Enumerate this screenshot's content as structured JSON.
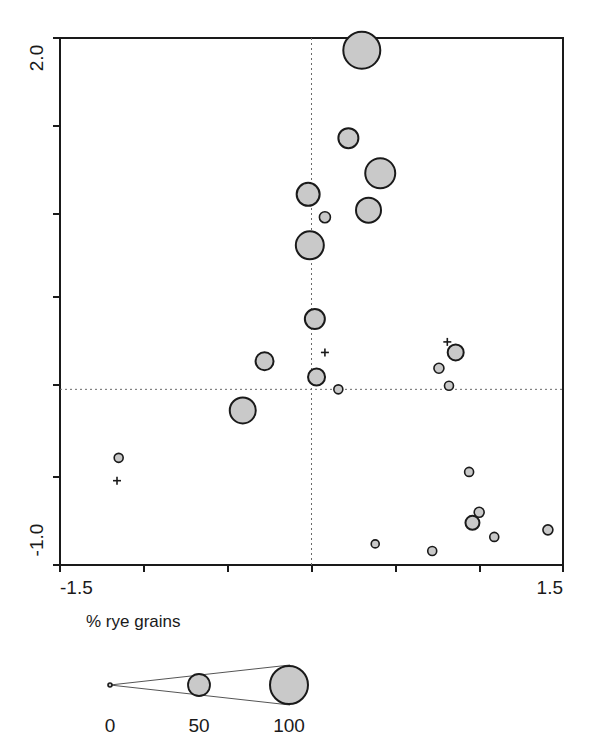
{
  "chart_data": {
    "type": "scatter",
    "title": "",
    "subtitle": "",
    "xlabel": "",
    "ylabel": "",
    "xlim": [
      -1.5,
      1.5
    ],
    "ylim": [
      -1.0,
      2.0
    ],
    "grid": false,
    "legend_position": "below-plot",
    "x_tick_labels": [
      "-1.5",
      "1.5"
    ],
    "y_tick_labels": [
      "2.0",
      "-1.0"
    ],
    "x_ticks": [
      -1.5,
      -1.0,
      -0.5,
      0.0,
      0.5,
      1.0,
      1.5
    ],
    "y_ticks": [
      2.0,
      1.5,
      1.0,
      0.5,
      0.0,
      -0.5,
      -1.0
    ],
    "reference_lines": [
      {
        "orientation": "vertical",
        "value": 0.0,
        "style": "dotted"
      },
      {
        "orientation": "horizontal",
        "value": 0.0,
        "style": "dotted"
      }
    ],
    "size_variable": "% rye grains",
    "size_legend": {
      "title": "% rye grains",
      "ticks": [
        "0",
        "50",
        "100"
      ],
      "values": [
        0,
        50,
        100
      ],
      "radii_px": [
        1,
        11,
        19
      ]
    },
    "marker_fill": "#c9c9c9",
    "marker_stroke": "#1a1a1a",
    "points": [
      {
        "x": 0.3,
        "y": 1.93,
        "size": 100,
        "r": 18.5,
        "label": ""
      },
      {
        "x": 0.22,
        "y": 1.43,
        "size": 66,
        "r": 10.0,
        "label": ""
      },
      {
        "x": 0.41,
        "y": 1.23,
        "size": 88,
        "r": 15.0,
        "label": ""
      },
      {
        "x": -0.02,
        "y": 1.11,
        "size": 72,
        "r": 11.5,
        "label": ""
      },
      {
        "x": 0.34,
        "y": 1.02,
        "size": 78,
        "r": 12.5,
        "label": ""
      },
      {
        "x": 0.08,
        "y": 0.98,
        "size": 30,
        "r": 5.5,
        "label": ""
      },
      {
        "x": -0.01,
        "y": 0.82,
        "size": 84,
        "r": 14.0,
        "label": ""
      },
      {
        "x": 0.02,
        "y": 0.4,
        "size": 66,
        "r": 10.0,
        "label": ""
      },
      {
        "x": -0.28,
        "y": 0.16,
        "size": 60,
        "r": 9.0,
        "label": ""
      },
      {
        "x": 0.03,
        "y": 0.07,
        "size": 58,
        "r": 8.5,
        "label": ""
      },
      {
        "x": 0.16,
        "y": 0.0,
        "size": 22,
        "r": 4.5,
        "label": ""
      },
      {
        "x": -0.41,
        "y": -0.12,
        "size": 80,
        "r": 13.0,
        "label": ""
      },
      {
        "x": 0.86,
        "y": 0.21,
        "size": 52,
        "r": 8.0,
        "label": ""
      },
      {
        "x": 0.76,
        "y": 0.12,
        "size": 24,
        "r": 5.0,
        "label": ""
      },
      {
        "x": 0.82,
        "y": 0.02,
        "size": 20,
        "r": 4.5,
        "label": ""
      },
      {
        "x": -1.15,
        "y": -0.39,
        "size": 22,
        "r": 4.5,
        "label": ""
      },
      {
        "x": 0.94,
        "y": -0.47,
        "size": 22,
        "r": 4.5,
        "label": ""
      },
      {
        "x": 1.0,
        "y": -0.7,
        "size": 24,
        "r": 5.0,
        "label": ""
      },
      {
        "x": 0.96,
        "y": -0.76,
        "size": 42,
        "r": 7.0,
        "label": ""
      },
      {
        "x": 1.09,
        "y": -0.84,
        "size": 22,
        "r": 4.5,
        "label": ""
      },
      {
        "x": 1.41,
        "y": -0.8,
        "size": 24,
        "r": 5.0,
        "label": ""
      },
      {
        "x": 0.38,
        "y": -0.88,
        "size": 20,
        "r": 4.0,
        "label": ""
      },
      {
        "x": 0.72,
        "y": -0.92,
        "size": 22,
        "r": 4.5,
        "label": ""
      }
    ],
    "cross_markers": [
      {
        "x": 0.08,
        "y": 0.21,
        "label": ""
      },
      {
        "x": 0.81,
        "y": 0.27,
        "label": ""
      },
      {
        "x": -1.16,
        "y": -0.52,
        "label": ""
      }
    ]
  },
  "plot": {
    "frame": {
      "left": 60,
      "top": 38,
      "right": 563,
      "bottom": 565
    },
    "y_axis": {
      "top_label": "2.0",
      "bottom_label": "-1.0"
    },
    "x_axis": {
      "left_label": "-1.5",
      "right_label": "1.5"
    }
  },
  "legend": {
    "title": "% rye grains",
    "tick_labels": [
      "0",
      "50",
      "100"
    ]
  }
}
